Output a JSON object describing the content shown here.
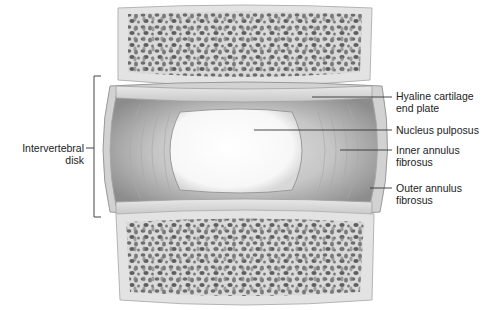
{
  "figure": {
    "labels": {
      "intervertebral_disk": [
        "Intervertebral",
        "disk"
      ],
      "hyaline": [
        "Hyaline cartilage",
        "end plate"
      ],
      "nucleus": [
        "Nucleus pulposus"
      ],
      "inner_annulus": [
        "Inner annulus",
        "fibrosus"
      ],
      "outer_annulus": [
        "Outer annulus",
        "fibrosus"
      ]
    },
    "colors": {
      "bone_fill": "#e6e6e6",
      "bone_trabeculae": "#6e6e6e",
      "disk_fill": "#bdbdbd",
      "nucleus_fill": "#fbfbfb",
      "leader_line": "#333333",
      "text": "#222222"
    }
  }
}
